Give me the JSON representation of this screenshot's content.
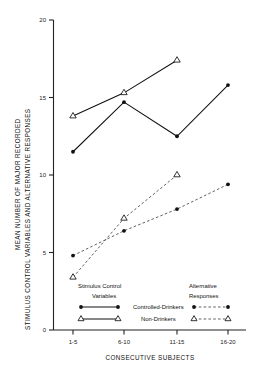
{
  "chart_data": {
    "type": "line",
    "title": "",
    "xlabel": "CONSECUTIVE SUBJECTS",
    "ylabel": "MEAN NUMBER OF MAJOR RECORDED STIMULUS CONTROL VARIABLES AND ALTERNATIVE RESPONSES",
    "ylabel_line1": "MEAN NUMBER OF MAJOR RECORDED",
    "ylabel_line2": "STIMULUS CONTROL VARIABLES AND ALTERNATIVE RESPONSES",
    "categories": [
      "1-5",
      "6-10",
      "11-15",
      "16-20"
    ],
    "x_tick_labels": [
      "1-5",
      "6-10",
      "11-15",
      "16-20"
    ],
    "y_tick_labels": [
      "0",
      "5",
      "10",
      "15",
      "20"
    ],
    "y_ticks": [
      0,
      5,
      10,
      15,
      20
    ],
    "ylim": [
      0,
      20
    ],
    "grid": false,
    "legend_position": "inside-bottom",
    "series": [
      {
        "name": "Stimulus Control Variables – Controlled-Drinkers",
        "group": "Stimulus Control Variables",
        "subject": "Controlled-Drinkers",
        "marker": "filled-circle",
        "linestyle": "solid",
        "color": "#111111",
        "x": [
          "1-5",
          "6-10",
          "11-15",
          "16-20"
        ],
        "values": [
          11.5,
          14.7,
          12.5,
          15.8
        ]
      },
      {
        "name": "Stimulus Control Variables – Non-Drinkers",
        "group": "Stimulus Control Variables",
        "subject": "Non-Drinkers",
        "marker": "open-triangle",
        "linestyle": "solid",
        "color": "#111111",
        "x": [
          "1-5",
          "6-10",
          "11-15"
        ],
        "values": [
          13.8,
          15.3,
          17.4
        ]
      },
      {
        "name": "Alternative Responses – Controlled-Drinkers",
        "group": "Alternative Responses",
        "subject": "Controlled-Drinkers",
        "marker": "filled-circle",
        "linestyle": "dashed",
        "color": "#444444",
        "x": [
          "1-5",
          "6-10",
          "11-15",
          "16-20"
        ],
        "values": [
          4.8,
          6.4,
          7.8,
          9.4
        ]
      },
      {
        "name": "Alternative Responses – Non-Drinkers",
        "group": "Alternative Responses",
        "subject": "Non-Drinkers",
        "marker": "open-triangle",
        "linestyle": "dashed",
        "color": "#444444",
        "x": [
          "1-5",
          "6-10",
          "11-15"
        ],
        "values": [
          3.4,
          7.2,
          10.0
        ]
      }
    ]
  },
  "legend": {
    "left_header_line1": "Stimulus Control",
    "left_header_line2": "Variables",
    "right_header_line1": "Alternative",
    "right_header_line2": "Responses",
    "row1_label": "Controlled-Drinkers",
    "row2_label": "Non-Drinkers"
  }
}
